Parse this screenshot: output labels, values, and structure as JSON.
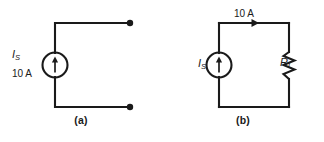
{
  "figure": {
    "type": "circuit-diagram",
    "background_color": "#ffffff",
    "line_color": "#1a1a1a",
    "text_color": "#1a1a1a"
  },
  "panels": [
    {
      "id": "a",
      "caption": "(a)",
      "source": {
        "symbol_name": "current-source",
        "arrow_direction": "up",
        "label_symbol": "I",
        "label_subscript": "S",
        "label_value": "10 A"
      },
      "terminals": {
        "count": 2,
        "style": "filled-dot",
        "state": "open-circuit"
      }
    },
    {
      "id": "b",
      "caption": "(b)",
      "source": {
        "symbol_name": "current-source",
        "arrow_direction": "up",
        "label_symbol": "I",
        "label_subscript": "S"
      },
      "load": {
        "symbol_name": "resistor",
        "label_symbol": "R",
        "label_subscript": "L"
      },
      "current_annotation": {
        "value": "10 A",
        "arrow_direction": "right",
        "position": "top-wire"
      }
    }
  ]
}
